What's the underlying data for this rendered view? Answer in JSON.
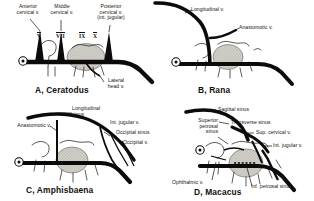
{
  "figure": {
    "background": "#ffffff",
    "ink": "#15110e",
    "shade": "#c9c6c0",
    "panel_count": 4
  },
  "panels": [
    {
      "id": "A",
      "title": "A, Ceratodus",
      "organism": "Ceratodus",
      "labels": [
        "Anterior\ncervical v.",
        "Middle\ncervical v.",
        "Posterior\ncervical v.\n(int. jugular)",
        "Lateral\nhead v."
      ],
      "nerve_numerals": [
        "V",
        "VII",
        "IX",
        "X"
      ]
    },
    {
      "id": "B",
      "title": "B, Rana",
      "organism": "Rana",
      "labels": [
        "Longitudinal v.",
        "Anastomotic v."
      ],
      "nerve_numerals": []
    },
    {
      "id": "C",
      "title": "C, Amphisbaena",
      "organism": "Amphisbaena",
      "labels": [
        "Longitudinal\nsinus",
        "Anastomotic v.",
        "Int. jugular v.",
        "Occipital sinus",
        "Occipital v."
      ],
      "nerve_numerals": []
    },
    {
      "id": "D",
      "title": "D, Macacus",
      "organism": "Macacus",
      "labels": [
        "Sagittal sinus",
        "Transverse sinus",
        "Sup. cervical v.",
        "Int. jugular v.",
        "Superior\npetrosal\nsinus",
        "Ophthalmic v.",
        "Inf. petrosal sinus"
      ],
      "nerve_numerals": []
    }
  ],
  "panel_a": {
    "title": "A, Ceratodus",
    "label_anterior_cervical": "Anterior\ncervical v.",
    "label_middle_cervical": "Middle\ncervical v.",
    "label_posterior_cervical": "Posterior\ncervical v.\n(int. jugular)",
    "label_lateral_head": "Lateral\nhead v.",
    "numeral_1": "V",
    "numeral_2": "VII",
    "numeral_3": "IX",
    "numeral_4": "X"
  },
  "panel_b": {
    "title": "B, Rana",
    "label_longitudinal": "Longitudinal v.",
    "label_anastomotic": "Anastomotic v."
  },
  "panel_c": {
    "title": "C, Amphisbaena",
    "label_longitudinal_sinus": "Longitudinal\nsinus",
    "label_anastomotic": "Anastomotic v.",
    "label_int_jugular": "Int. jugular v.",
    "label_occipital_sinus": "Occipital sinus",
    "label_occipital_v": "Occipital v."
  },
  "panel_d": {
    "title": "D, Macacus",
    "label_sagittal_sinus": "Sagittal sinus",
    "label_transverse_sinus": "Transverse sinus",
    "label_sup_cervical": "Sup. cervical v.",
    "label_int_jugular": "Int. jugular v.",
    "label_superior_petrosal": "Superior\npetrosal\nsinus",
    "label_ophthalmic": "Ophthalmic v.",
    "label_inf_petrosal": "Inf. petrosal sinus"
  }
}
